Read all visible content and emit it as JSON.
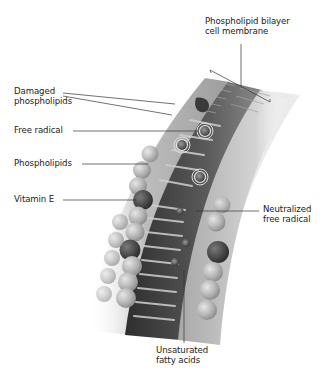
{
  "figure": {
    "labels": {
      "bilayer": {
        "line1": "Phospholipid bilayer",
        "line2": "cell membrane"
      },
      "damaged": {
        "line1": "Damaged",
        "line2": "phospholipids"
      },
      "free_radical": {
        "text": "Free radical"
      },
      "phospholipids": {
        "text": "Phospholipids"
      },
      "vitamin_e": {
        "text": "Vitamin E"
      },
      "neutralized": {
        "line1": "Neutralized",
        "line2": "free radical"
      },
      "unsaturated": {
        "line1": "Unsaturated",
        "line2": "fatty acids"
      }
    },
    "colors": {
      "background": "#ffffff",
      "text": "#222222",
      "leader_line": "#333333",
      "head_light": "#c8c8c8",
      "head_dark": "#4a4a4a",
      "interior_dark": "#3a3a3a"
    }
  }
}
